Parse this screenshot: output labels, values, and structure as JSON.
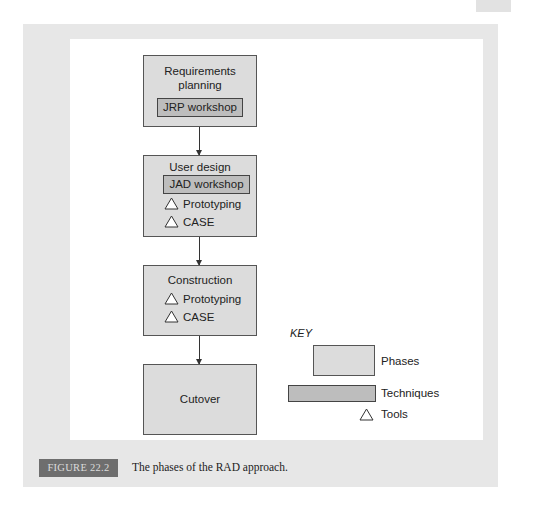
{
  "diagram": {
    "type": "flowchart",
    "phases": [
      {
        "title": "Requirements planning",
        "title_lines": [
          "Requirements",
          "planning"
        ],
        "techniques": [
          "JRP workshop"
        ],
        "tools": []
      },
      {
        "title": "User design",
        "title_lines": [
          "User design"
        ],
        "techniques": [
          "JAD workshop"
        ],
        "tools": [
          "Prototyping",
          "CASE"
        ]
      },
      {
        "title": "Construction",
        "title_lines": [
          "Construction"
        ],
        "techniques": [],
        "tools": [
          "Prototyping",
          "CASE"
        ]
      },
      {
        "title": "Cutover",
        "title_lines": [
          "Cutover"
        ],
        "techniques": [],
        "tools": []
      }
    ],
    "edges": [
      {
        "from": "Requirements planning",
        "to": "User design"
      },
      {
        "from": "User design",
        "to": "Construction"
      },
      {
        "from": "Construction",
        "to": "Cutover"
      }
    ]
  },
  "key": {
    "title": "KEY",
    "items": [
      {
        "shape": "box-light",
        "label": "Phases"
      },
      {
        "shape": "box-dark",
        "label": "Techniques"
      },
      {
        "shape": "triangle-icon",
        "label": "Tools"
      }
    ]
  },
  "figure": {
    "number": "FIGURE 22.2",
    "caption": "The phases of the RAD approach."
  },
  "colors": {
    "phase_fill": "#dcdcdc",
    "technique_fill": "#bdbdbd",
    "panel_bg": "#e7e7e7",
    "badge_bg": "#6e6e6e"
  }
}
